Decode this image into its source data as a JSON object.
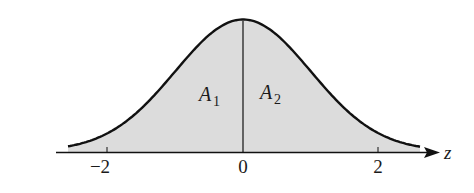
{
  "chart_data": {
    "type": "area",
    "xlabel": "z",
    "ylabel": "",
    "x_ticks": [
      "-2",
      "0",
      "2"
    ],
    "xlim": [
      -2.6,
      2.6
    ],
    "regions": [
      {
        "name": "A1",
        "label": "A",
        "subscript": "1",
        "from": "-inf",
        "to": 0
      },
      {
        "name": "A2",
        "label": "A",
        "subscript": "2",
        "from": 0,
        "to": "inf"
      }
    ],
    "grid": false,
    "fill_color": "#d9d9d9",
    "line_color": "#111111"
  },
  "labels": {
    "axis": "z",
    "tick_neg2": "−2",
    "tick_0": "0",
    "tick_2": "2",
    "a1": "A",
    "a1_sub": "1",
    "a2": "A",
    "a2_sub": "2"
  }
}
